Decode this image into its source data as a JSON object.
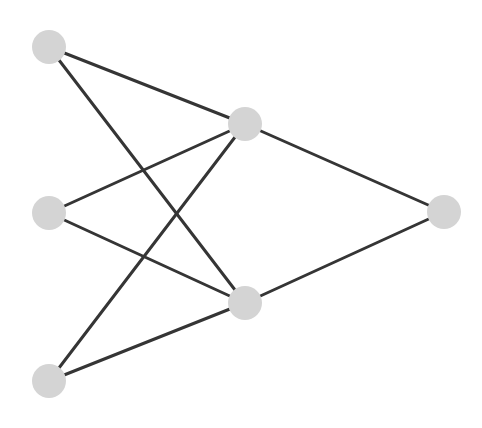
{
  "diagram": {
    "type": "neural-network",
    "layers": [
      {
        "name": "input",
        "size": 3
      },
      {
        "name": "hidden",
        "size": 2
      },
      {
        "name": "output",
        "size": 1
      }
    ],
    "colors": {
      "node_fill": "#d4d4d4",
      "edge": "#353535",
      "background": "#ffffff"
    },
    "node_radius": 17,
    "nodes": [
      {
        "id": "in1",
        "layer": "input",
        "x": 49,
        "y": 47
      },
      {
        "id": "in2",
        "layer": "input",
        "x": 49,
        "y": 213
      },
      {
        "id": "in3",
        "layer": "input",
        "x": 49,
        "y": 381
      },
      {
        "id": "h1",
        "layer": "hidden",
        "x": 245,
        "y": 124
      },
      {
        "id": "h2",
        "layer": "hidden",
        "x": 245,
        "y": 303
      },
      {
        "id": "out1",
        "layer": "output",
        "x": 444,
        "y": 212
      }
    ],
    "edges": [
      {
        "from": "in1",
        "to": "h1"
      },
      {
        "from": "in1",
        "to": "h2"
      },
      {
        "from": "in2",
        "to": "h1"
      },
      {
        "from": "in2",
        "to": "h2"
      },
      {
        "from": "in3",
        "to": "h1"
      },
      {
        "from": "in3",
        "to": "h2"
      },
      {
        "from": "h1",
        "to": "out1"
      },
      {
        "from": "h2",
        "to": "out1"
      }
    ]
  }
}
